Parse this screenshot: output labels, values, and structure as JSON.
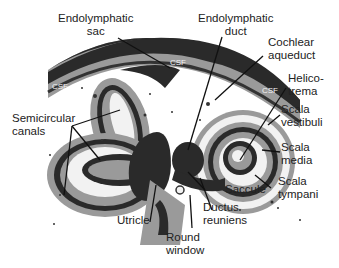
{
  "diagram": {
    "labels": {
      "endolymphatic_sac": "Endolymphatic\nsac",
      "endolymphatic_duct": "Endolymphatic\nduct",
      "cochlear_aqueduct": "Cochlear\naqueduct",
      "helicotrema": "Helico-\ntrema",
      "scala_vestibuli": "Scala\nvestibuli",
      "scala_media": "Scala\nmedia",
      "scala_tympani": "Scala\ntympani",
      "semicircular_canals": "Semicircular\ncanals",
      "saccule": "Saccule",
      "ductus_reuniens": "Ductus\nreuniens",
      "utricle": "Utricle",
      "round_window": "Round\nwindow"
    },
    "csf_labels": [
      "CSF",
      "CSF",
      "CSF"
    ],
    "colors": {
      "dark": "#2a2a2a",
      "mid_gray": "#9a9a9a",
      "light_fill": "#f2f2f2",
      "line": "#111111"
    }
  }
}
